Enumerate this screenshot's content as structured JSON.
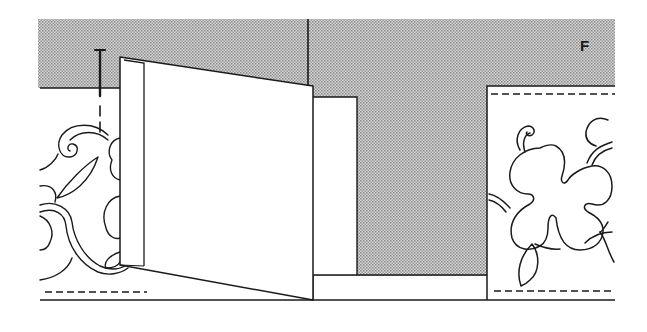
{
  "figure": {
    "panel_label": "F",
    "colors": {
      "shade": "#b8b8b8",
      "ink": "#1a1a1a",
      "paper": "#ffffff"
    },
    "elements": [
      {
        "name": "shaded-background",
        "type": "region"
      },
      {
        "name": "left-floral-panel",
        "type": "artwork"
      },
      {
        "name": "open-flap",
        "type": "shape"
      },
      {
        "name": "nail-marker",
        "type": "marker"
      },
      {
        "name": "center-inset-panel",
        "type": "shape"
      },
      {
        "name": "right-floral-panel",
        "type": "artwork"
      },
      {
        "name": "fold-dashed-lines",
        "type": "guide"
      }
    ]
  }
}
